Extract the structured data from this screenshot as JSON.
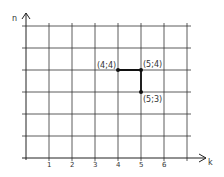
{
  "chart_data": {
    "type": "diagram",
    "title": "",
    "xlabel": "k",
    "ylabel": "n",
    "x_range": [
      0,
      7
    ],
    "y_range": [
      0,
      6
    ],
    "grid": true,
    "x_tick_labels": [
      "1",
      "2",
      "3",
      "4",
      "5",
      "6"
    ],
    "y_tick_labels": [],
    "points": [
      {
        "x": 4,
        "y": 4,
        "label": "(4;4)"
      },
      {
        "x": 5,
        "y": 4,
        "label": "(5;4)"
      },
      {
        "x": 5,
        "y": 3,
        "label": "(5;3)"
      }
    ],
    "path": [
      [
        4,
        4
      ],
      [
        5,
        4
      ],
      [
        5,
        3
      ]
    ]
  }
}
